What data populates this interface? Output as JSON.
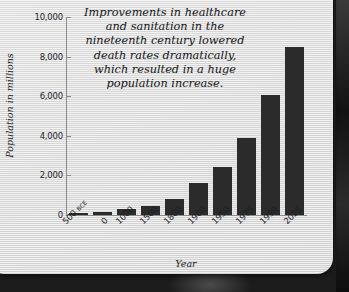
{
  "chart_data": {
    "type": "bar",
    "title": "",
    "xlabel": "Year",
    "ylabel": "Population in millions",
    "categories": [
      "500 BCE",
      "0",
      "1000",
      "1500",
      "1800",
      "1900",
      "1950",
      "1975",
      "1999",
      "2025"
    ],
    "category_parts": [
      {
        "main": "500 ",
        "suffix": "BCE"
      },
      {
        "main": "0",
        "suffix": ""
      },
      {
        "main": "1000",
        "suffix": ""
      },
      {
        "main": "1500",
        "suffix": ""
      },
      {
        "main": "1800",
        "suffix": ""
      },
      {
        "main": "1900",
        "suffix": ""
      },
      {
        "main": "1950",
        "suffix": ""
      },
      {
        "main": "1975",
        "suffix": ""
      },
      {
        "main": "1999",
        "suffix": ""
      },
      {
        "main": "2025",
        "suffix": ""
      }
    ],
    "values": [
      100,
      170,
      310,
      460,
      820,
      1600,
      2400,
      3900,
      6050,
      8500
    ],
    "ylim": [
      0,
      10000
    ],
    "yticks": [
      "10,000",
      "8,000",
      "6,000",
      "4,000",
      "2,000",
      "0"
    ],
    "ytick_values": [
      10000,
      8000,
      6000,
      4000,
      2000,
      0
    ],
    "grid": false,
    "legend": "none",
    "bar_color": "#2b2b2b",
    "annotation": "Improvements in healthcare and sanitation in the nineteenth century lowered death rates dramatically, which resulted in a huge population increase."
  },
  "annotation_lines": [
    "Improvements in healthcare",
    "and sanitation in the",
    "nineteenth century lowered",
    "death rates dramatically,",
    "which resulted in a huge",
    "population increase."
  ],
  "colors": {
    "bar": "#2b2b2b",
    "panel": "#e4e4e4",
    "axis": "#8a8a8a",
    "text": "#1e1e1e",
    "backdrop": "#1a1a1a"
  }
}
